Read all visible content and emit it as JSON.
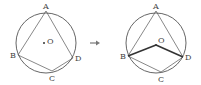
{
  "figure": {
    "left": {
      "circle": {
        "cx": 46,
        "cy": 43,
        "r": 30
      },
      "points": {
        "A": {
          "x": 46,
          "y": 11,
          "label": "A",
          "lx": 43,
          "ly": 9
        },
        "B": {
          "x": 18,
          "y": 55,
          "label": "B",
          "lx": 10,
          "ly": 58
        },
        "C": {
          "x": 52,
          "y": 71,
          "label": "C",
          "lx": 49,
          "ly": 81
        },
        "D": {
          "x": 73,
          "y": 58,
          "label": "D",
          "lx": 75,
          "ly": 61
        },
        "O": {
          "x": 44,
          "y": 43,
          "label": "O",
          "lx": 47,
          "ly": 44
        }
      },
      "segments": [
        [
          "A",
          "B"
        ],
        [
          "A",
          "D"
        ],
        [
          "B",
          "C"
        ],
        [
          "C",
          "D"
        ]
      ]
    },
    "arrow": {
      "symbol": "→",
      "x1": 90,
      "x2": 100,
      "y": 43
    },
    "right": {
      "circle": {
        "cx": 156,
        "cy": 43,
        "r": 30
      },
      "points": {
        "A": {
          "x": 156,
          "y": 11,
          "label": "A",
          "lx": 153,
          "ly": 9
        },
        "B": {
          "x": 128,
          "y": 56,
          "label": "B",
          "lx": 120,
          "ly": 59
        },
        "C": {
          "x": 161,
          "y": 72,
          "label": "C",
          "lx": 158,
          "ly": 82
        },
        "D": {
          "x": 183,
          "y": 57,
          "label": "D",
          "lx": 185,
          "ly": 60
        },
        "O": {
          "x": 156,
          "y": 45,
          "label": "O",
          "lx": 158,
          "ly": 43
        }
      },
      "segments": [
        [
          "A",
          "B"
        ],
        [
          "A",
          "D"
        ],
        [
          "B",
          "C"
        ],
        [
          "C",
          "D"
        ]
      ],
      "bold_segments": [
        [
          "B",
          "O"
        ],
        [
          "O",
          "D"
        ]
      ]
    },
    "colors": {
      "stroke": "#555555",
      "bold_stroke": "#333333",
      "text": "#444444",
      "background": "#ffffff"
    }
  }
}
